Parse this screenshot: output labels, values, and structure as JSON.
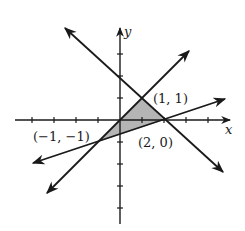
{
  "figure": {
    "type": "coordinate-plane",
    "axes": {
      "x_label": "x",
      "y_label": "y",
      "x_range": [
        -4,
        5
      ],
      "y_range": [
        -5,
        4
      ],
      "tick_spacing": 1
    },
    "lines": [
      {
        "name": "line-y-equals-x",
        "equation": "y = x"
      },
      {
        "name": "line-y-equals-neg-x-plus-2",
        "equation": "y = -x + 2"
      },
      {
        "name": "line-through-neg1-neg1-and-2-0",
        "equation": "y = (x - 2) / 3"
      }
    ],
    "shaded_region": {
      "vertices": [
        [
          -1,
          -1
        ],
        [
          1,
          1
        ],
        [
          2,
          0
        ]
      ],
      "fill": "#b5b5b5"
    },
    "point_labels": [
      {
        "text": "(1, 1)",
        "point": [
          1,
          1
        ]
      },
      {
        "text": "(2, 0)",
        "point": [
          2,
          0
        ]
      },
      {
        "text": "(−1, −1)",
        "point": [
          -1,
          -1
        ]
      }
    ],
    "colors": {
      "ink": "#1a1a1a",
      "background": "#ffffff",
      "shade": "#b5b5b5"
    }
  }
}
